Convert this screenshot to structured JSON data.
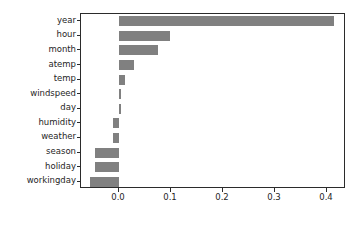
{
  "chart_data": {
    "type": "bar",
    "orientation": "horizontal",
    "title": "",
    "xlabel": "",
    "ylabel": "",
    "categories": [
      "year",
      "hour",
      "month",
      "atemp",
      "temp",
      "windspeed",
      "day",
      "humidity",
      "weather",
      "season",
      "holiday",
      "workingday"
    ],
    "values": [
      0.413,
      0.098,
      0.075,
      0.029,
      0.011,
      0.004,
      0.003,
      -0.012,
      -0.012,
      -0.046,
      -0.047,
      -0.056
    ],
    "xticks": [
      0.0,
      0.1,
      0.2,
      0.3,
      0.4
    ],
    "xtick_labels": [
      "0.0",
      "0.1",
      "0.2",
      "0.3",
      "0.4"
    ],
    "xlim": [
      -0.0731,
      0.4365
    ],
    "grid": false,
    "legend": null,
    "bar_color": "#808080",
    "axes_color": "#2b2b2b",
    "background_color": "#ffffff"
  }
}
